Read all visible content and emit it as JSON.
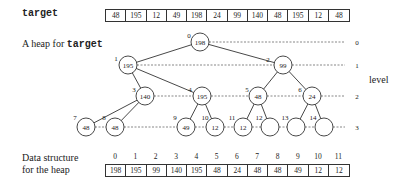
{
  "target_label": "target",
  "target_array": [
    "48",
    "195",
    "12",
    "49",
    "198",
    "24",
    "99",
    "140",
    "48",
    "195",
    "12",
    "48"
  ],
  "heap_title_prefix": "A heap for ",
  "heap_title_code": "target",
  "level_label": "level",
  "levels": [
    "0",
    "1",
    "2",
    "3"
  ],
  "nodes": [
    {
      "index": "0",
      "value": "198"
    },
    {
      "index": "1",
      "value": "195"
    },
    {
      "index": "2",
      "value": "99"
    },
    {
      "index": "3",
      "value": "140"
    },
    {
      "index": "4",
      "value": "195"
    },
    {
      "index": "5",
      "value": "48"
    },
    {
      "index": "6",
      "value": "24"
    },
    {
      "index": "7",
      "value": "48"
    },
    {
      "index": "8",
      "value": "48"
    },
    {
      "index": "9",
      "value": "49"
    },
    {
      "index": "10",
      "value": "12"
    },
    {
      "index": "11",
      "value": "12"
    },
    {
      "index": "12",
      "value": ""
    },
    {
      "index": "13",
      "value": ""
    },
    {
      "index": "14",
      "value": ""
    }
  ],
  "ds_label_line1": "Data structure",
  "ds_label_line2": "for the heap",
  "ds_indices": [
    "0",
    "1",
    "2",
    "3",
    "4",
    "5",
    "6",
    "7",
    "8",
    "9",
    "10",
    "11"
  ],
  "ds_array": [
    "198",
    "195",
    "99",
    "140",
    "195",
    "48",
    "24",
    "48",
    "48",
    "49",
    "12",
    "12"
  ]
}
